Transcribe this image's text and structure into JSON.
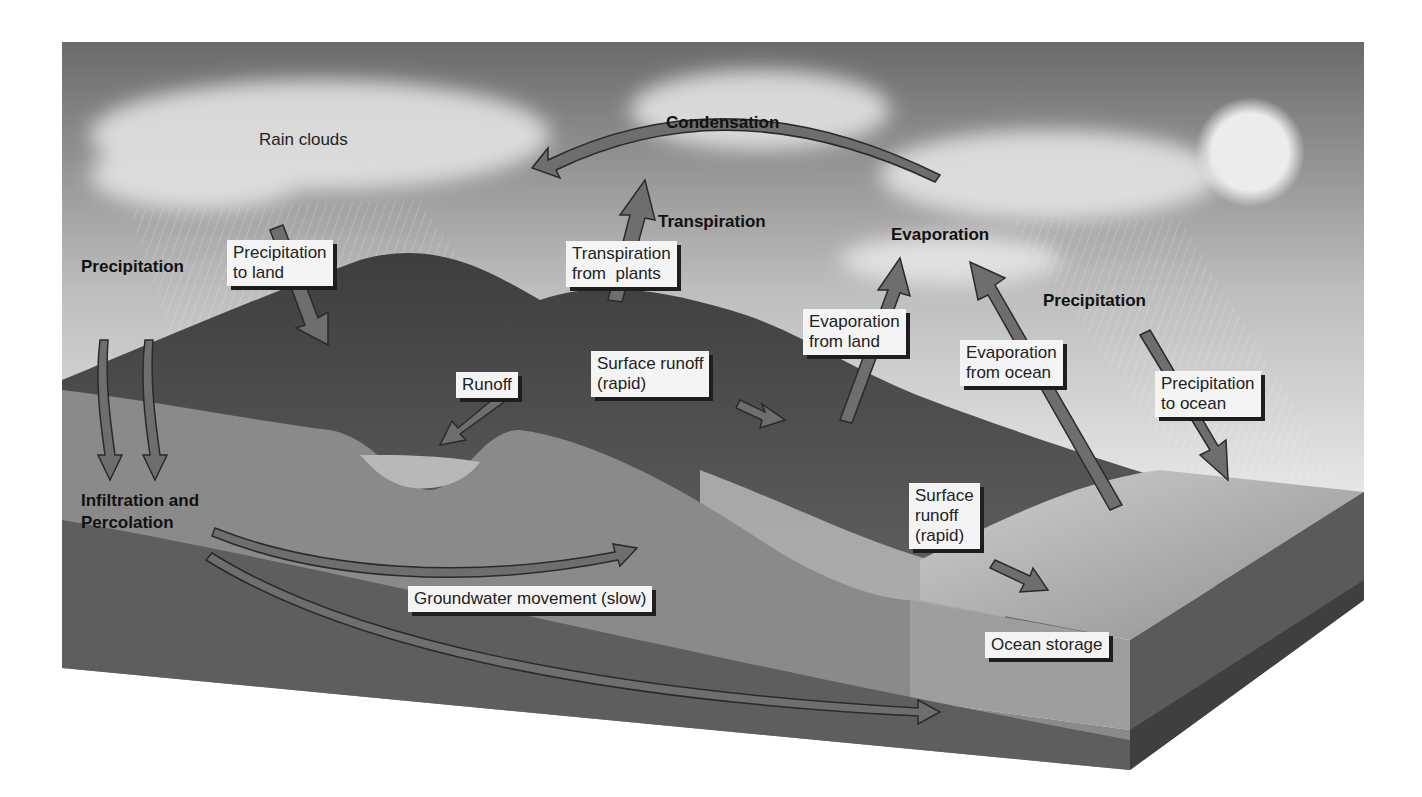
{
  "diagram": {
    "title_labels": {
      "condensation": "Condensation",
      "transpiration": "Transpiration",
      "evaporation": "Evaporation",
      "precipitation_left": "Precipitation",
      "precipitation_right": "Precipitation",
      "infiltration": "Infiltration and\nPercolation"
    },
    "plain_labels": {
      "rain_clouds": "Rain clouds"
    },
    "boxed_labels": {
      "precip_land": "Precipitation\nto land",
      "transp_plants": "Transpiration\nfrom  plants",
      "evap_land": "Evaporation\nfrom land",
      "evap_ocean": "Evaporation\nfrom ocean",
      "precip_ocean": "Precipitation\nto ocean",
      "runoff": "Runoff",
      "surface_runoff_1": "Surface runoff\n(rapid)",
      "surface_runoff_2": "Surface\nrunoff\n(rapid)",
      "groundwater": "Groundwater movement (slow)",
      "ocean_storage": "Ocean storage"
    },
    "colors": {
      "sky_dark": "#6b6b6b",
      "sky_light": "#e6e6e6",
      "arrow_fill": "#6e6e6e",
      "arrow_stroke": "#2a2a2a",
      "ground": "#8a8a8a",
      "ground_dark": "#5e5e5e",
      "ocean": "#a9a9a9",
      "sun": "#ececec"
    }
  }
}
